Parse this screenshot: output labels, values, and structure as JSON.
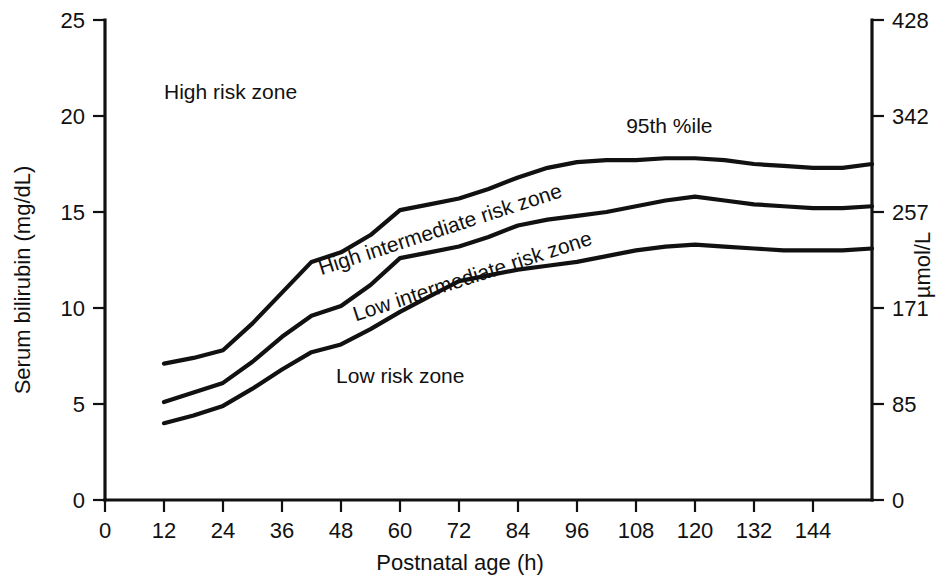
{
  "chart_data": {
    "type": "line",
    "title": "",
    "xlabel": "Postnatal age (h)",
    "ylabel": "Serum bilirubin (mg/dL)",
    "ylabel_right": "µmol/L",
    "xlim": [
      0,
      156
    ],
    "ylim": [
      0,
      25
    ],
    "ylim_right": [
      0,
      428
    ],
    "grid": false,
    "legend_position": "inline-annotations",
    "xticks": [
      0,
      12,
      24,
      36,
      48,
      60,
      72,
      84,
      96,
      108,
      120,
      132,
      144
    ],
    "xtick_labels": [
      "0",
      "12",
      "24",
      "36",
      "48",
      "60",
      "72",
      "84",
      "96",
      "108",
      "120",
      "132",
      "144"
    ],
    "yticks": [
      0,
      5,
      10,
      15,
      20,
      25
    ],
    "ytick_labels": [
      "0",
      "5",
      "10",
      "15",
      "20",
      "25"
    ],
    "yticks_right": [
      0,
      85,
      171,
      257,
      342,
      428
    ],
    "ytick_labels_right": [
      "0",
      "85",
      "171",
      "257",
      "342",
      "428"
    ],
    "series": [
      {
        "name": "95th %ile",
        "x": [
          12,
          18,
          24,
          30,
          36,
          42,
          48,
          54,
          60,
          66,
          72,
          78,
          84,
          90,
          96,
          102,
          108,
          114,
          120,
          126,
          132,
          138,
          144,
          150,
          156
        ],
        "y": [
          7.1,
          7.4,
          7.8,
          9.2,
          10.8,
          12.4,
          12.9,
          13.8,
          15.1,
          15.4,
          15.7,
          16.2,
          16.8,
          17.3,
          17.6,
          17.7,
          17.7,
          17.8,
          17.8,
          17.7,
          17.5,
          17.4,
          17.3,
          17.3,
          17.5
        ]
      },
      {
        "name": "75th %ile",
        "x": [
          12,
          18,
          24,
          30,
          36,
          42,
          48,
          54,
          60,
          66,
          72,
          78,
          84,
          90,
          96,
          102,
          108,
          114,
          120,
          126,
          132,
          138,
          144,
          150,
          156
        ],
        "y": [
          5.1,
          5.6,
          6.1,
          7.2,
          8.5,
          9.6,
          10.1,
          11.2,
          12.6,
          12.9,
          13.2,
          13.7,
          14.3,
          14.6,
          14.8,
          15.0,
          15.3,
          15.6,
          15.8,
          15.6,
          15.4,
          15.3,
          15.2,
          15.2,
          15.3
        ]
      },
      {
        "name": "40th %ile",
        "x": [
          12,
          18,
          24,
          30,
          36,
          42,
          48,
          54,
          60,
          66,
          72,
          78,
          84,
          90,
          96,
          102,
          108,
          114,
          120,
          126,
          132,
          138,
          144,
          150,
          156
        ],
        "y": [
          4.0,
          4.4,
          4.9,
          5.8,
          6.8,
          7.7,
          8.1,
          8.9,
          9.8,
          10.6,
          11.4,
          11.7,
          12.0,
          12.2,
          12.4,
          12.7,
          13.0,
          13.2,
          13.3,
          13.2,
          13.1,
          13.0,
          13.0,
          13.0,
          13.1
        ]
      }
    ],
    "annotations": [
      {
        "text": "High risk zone",
        "x": 12,
        "y": 20.9,
        "rotation": 0,
        "name": "high-risk-zone-label"
      },
      {
        "text": "95th %ile",
        "x": 106,
        "y": 19.1,
        "rotation": 0,
        "name": "percentile-95-label"
      },
      {
        "text": "High intermediate risk zone",
        "x": 44,
        "y": 11.7,
        "rotation": -18,
        "name": "high-intermediate-risk-zone-label"
      },
      {
        "text": "Low intermediate risk zone",
        "x": 51,
        "y": 9.3,
        "rotation": -18,
        "name": "low-intermediate-risk-zone-label"
      },
      {
        "text": "Low risk zone",
        "x": 47,
        "y": 6.1,
        "rotation": 0,
        "name": "low-risk-zone-label"
      }
    ]
  }
}
